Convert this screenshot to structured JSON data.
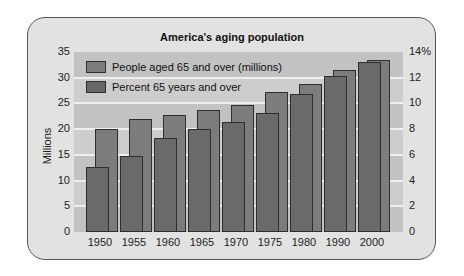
{
  "chart_data": {
    "type": "bar",
    "title": "America's aging population",
    "xlabel": "",
    "ylabel": "Millions",
    "ylabel_right": "",
    "categories": [
      "1950",
      "1955",
      "1960",
      "1965",
      "1970",
      "1975",
      "1980",
      "1990",
      "2000"
    ],
    "series": [
      {
        "name": "People aged 65 and over (millions)",
        "axis": "left",
        "values": [
          12.7,
          14.8,
          18.3,
          20.1,
          21.4,
          23.2,
          26.9,
          30.4,
          33.0
        ]
      },
      {
        "name": "Percent 65 years and over",
        "axis": "right",
        "values": [
          8.0,
          8.8,
          9.1,
          9.5,
          9.9,
          10.9,
          11.5,
          12.6,
          13.4
        ]
      }
    ],
    "ylim": [
      0,
      35
    ],
    "ylim_right": [
      0,
      14
    ],
    "left_ticks": [
      "0",
      "5",
      "10",
      "15",
      "20",
      "25",
      "30",
      "35"
    ],
    "right_ticks": [
      "0",
      "2",
      "4",
      "6",
      "8",
      "10",
      "12",
      "14%"
    ],
    "grid": true,
    "legend_position": "upper-left inside"
  },
  "colors": {
    "frame_bg": "#e2e2e2",
    "band_light": "#cdcdcd",
    "band_dark": "#c2c2c2",
    "millions_bar": "#6a6a6a",
    "percent_bar": "#7c7c7c"
  }
}
